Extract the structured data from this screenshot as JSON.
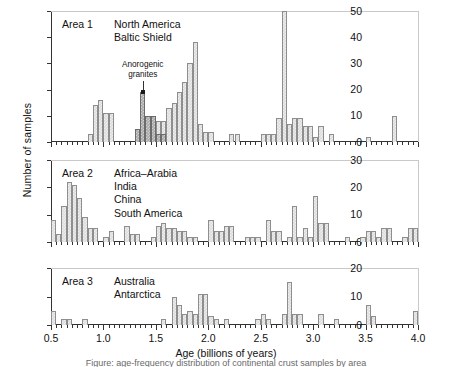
{
  "figure": {
    "xlabel": "Age (billions of years)",
    "ylabel": "Number of samples",
    "caption": "Figure: age-frequency distribution of continental crust samples by area"
  },
  "annotation": {
    "line1": "Anorogenic",
    "line2": "granites"
  },
  "panels": [
    {
      "area": "Area 1",
      "regions": [
        "North America",
        "Baltic Shield"
      ],
      "yticks": [
        0,
        10,
        20,
        30,
        40,
        50
      ],
      "ymax": 50
    },
    {
      "area": "Area 2",
      "regions": [
        "Africa–Arabia",
        "India",
        "China",
        "South America"
      ],
      "yticks": [
        0,
        10,
        20,
        30
      ],
      "ymax": 30
    },
    {
      "area": "Area 3",
      "regions": [
        "Australia",
        "Antarctica"
      ],
      "yticks": [
        0,
        10,
        20
      ],
      "ymax": 20
    }
  ],
  "xticks_major": [
    "0.5",
    "1.0",
    "1.5",
    "2.0",
    "2.5",
    "3.0",
    "3.5",
    "4.0"
  ],
  "chart_data": {
    "type": "bar",
    "xlabel": "Age (billions of years)",
    "ylabel": "Number of samples",
    "xlim": [
      0.5,
      4.0
    ],
    "bin_width": 0.05,
    "grid": false,
    "legend": null,
    "panels": [
      {
        "name": "Area 1",
        "regions": [
          "North America",
          "Baltic Shield"
        ],
        "ylim": [
          0,
          50
        ],
        "yticks": [
          0,
          10,
          20,
          30,
          40,
          50
        ],
        "series": [
          {
            "name": "samples",
            "fill": "light",
            "bins": [
              {
                "x": 0.85,
                "v": 3
              },
              {
                "x": 0.9,
                "v": 14
              },
              {
                "x": 0.95,
                "v": 16
              },
              {
                "x": 1.0,
                "v": 11
              },
              {
                "x": 1.05,
                "v": 11
              },
              {
                "x": 1.5,
                "v": 8
              },
              {
                "x": 1.55,
                "v": 8
              },
              {
                "x": 1.6,
                "v": 13
              },
              {
                "x": 1.65,
                "v": 15
              },
              {
                "x": 1.7,
                "v": 19
              },
              {
                "x": 1.75,
                "v": 23
              },
              {
                "x": 1.8,
                "v": 30
              },
              {
                "x": 1.85,
                "v": 38
              },
              {
                "x": 1.9,
                "v": 7
              },
              {
                "x": 1.95,
                "v": 4
              },
              {
                "x": 2.0,
                "v": 4
              },
              {
                "x": 2.2,
                "v": 3
              },
              {
                "x": 2.25,
                "v": 3
              },
              {
                "x": 2.5,
                "v": 3
              },
              {
                "x": 2.55,
                "v": 3
              },
              {
                "x": 2.6,
                "v": 3
              },
              {
                "x": 2.65,
                "v": 9
              },
              {
                "x": 2.7,
                "v": 50
              },
              {
                "x": 2.75,
                "v": 7
              },
              {
                "x": 2.8,
                "v": 9
              },
              {
                "x": 2.85,
                "v": 9
              },
              {
                "x": 2.9,
                "v": 6
              },
              {
                "x": 2.95,
                "v": 6
              },
              {
                "x": 3.0,
                "v": 2
              },
              {
                "x": 3.05,
                "v": 6
              },
              {
                "x": 3.15,
                "v": 3
              },
              {
                "x": 3.5,
                "v": 2
              },
              {
                "x": 3.75,
                "v": 10
              }
            ]
          },
          {
            "name": "anorogenic granites",
            "fill": "dark",
            "bins": [
              {
                "x": 1.3,
                "v": 5
              },
              {
                "x": 1.35,
                "v": 19
              },
              {
                "x": 1.4,
                "v": 10
              },
              {
                "x": 1.45,
                "v": 10
              },
              {
                "x": 1.5,
                "v": 3
              },
              {
                "x": 1.55,
                "v": 3
              }
            ]
          }
        ]
      },
      {
        "name": "Area 2",
        "regions": [
          "Africa–Arabia",
          "India",
          "China",
          "South America"
        ],
        "ylim": [
          0,
          30
        ],
        "yticks": [
          0,
          10,
          20,
          30
        ],
        "series": [
          {
            "name": "samples",
            "fill": "light",
            "bins": [
              {
                "x": 0.5,
                "v": 8
              },
              {
                "x": 0.55,
                "v": 3
              },
              {
                "x": 0.6,
                "v": 13
              },
              {
                "x": 0.65,
                "v": 22
              },
              {
                "x": 0.7,
                "v": 21
              },
              {
                "x": 0.75,
                "v": 16
              },
              {
                "x": 0.8,
                "v": 9
              },
              {
                "x": 0.85,
                "v": 5
              },
              {
                "x": 0.9,
                "v": 5
              },
              {
                "x": 1.0,
                "v": 2
              },
              {
                "x": 1.05,
                "v": 4
              },
              {
                "x": 1.2,
                "v": 6
              },
              {
                "x": 1.25,
                "v": 3
              },
              {
                "x": 1.3,
                "v": 3
              },
              {
                "x": 1.45,
                "v": 2
              },
              {
                "x": 1.5,
                "v": 6
              },
              {
                "x": 1.55,
                "v": 7
              },
              {
                "x": 1.6,
                "v": 5
              },
              {
                "x": 1.65,
                "v": 5
              },
              {
                "x": 1.7,
                "v": 4
              },
              {
                "x": 1.75,
                "v": 4
              },
              {
                "x": 1.8,
                "v": 2
              },
              {
                "x": 1.85,
                "v": 2
              },
              {
                "x": 2.0,
                "v": 8
              },
              {
                "x": 2.05,
                "v": 4
              },
              {
                "x": 2.1,
                "v": 4
              },
              {
                "x": 2.15,
                "v": 6
              },
              {
                "x": 2.2,
                "v": 6
              },
              {
                "x": 2.35,
                "v": 2
              },
              {
                "x": 2.4,
                "v": 2
              },
              {
                "x": 2.45,
                "v": 2
              },
              {
                "x": 2.55,
                "v": 8
              },
              {
                "x": 2.6,
                "v": 4
              },
              {
                "x": 2.65,
                "v": 4
              },
              {
                "x": 2.75,
                "v": 2
              },
              {
                "x": 2.8,
                "v": 13
              },
              {
                "x": 2.85,
                "v": 2
              },
              {
                "x": 2.9,
                "v": 5
              },
              {
                "x": 2.95,
                "v": 2
              },
              {
                "x": 3.0,
                "v": 17
              },
              {
                "x": 3.05,
                "v": 7
              },
              {
                "x": 3.1,
                "v": 7
              },
              {
                "x": 3.3,
                "v": 2
              },
              {
                "x": 3.45,
                "v": 2
              },
              {
                "x": 3.5,
                "v": 4
              },
              {
                "x": 3.55,
                "v": 4
              },
              {
                "x": 3.6,
                "v": 2
              },
              {
                "x": 3.65,
                "v": 5
              },
              {
                "x": 3.7,
                "v": 5
              },
              {
                "x": 3.85,
                "v": 2
              },
              {
                "x": 3.9,
                "v": 5
              },
              {
                "x": 3.95,
                "v": 5
              }
            ]
          }
        ]
      },
      {
        "name": "Area 3",
        "regions": [
          "Australia",
          "Antarctica"
        ],
        "ylim": [
          0,
          20
        ],
        "yticks": [
          0,
          10,
          20
        ],
        "series": [
          {
            "name": "samples",
            "fill": "light",
            "bins": [
              {
                "x": 0.5,
                "v": 5
              },
              {
                "x": 0.6,
                "v": 2
              },
              {
                "x": 0.65,
                "v": 2
              },
              {
                "x": 0.8,
                "v": 2
              },
              {
                "x": 1.55,
                "v": 2
              },
              {
                "x": 1.65,
                "v": 10
              },
              {
                "x": 1.7,
                "v": 7
              },
              {
                "x": 1.75,
                "v": 4
              },
              {
                "x": 1.8,
                "v": 5
              },
              {
                "x": 1.85,
                "v": 4
              },
              {
                "x": 1.9,
                "v": 11
              },
              {
                "x": 1.95,
                "v": 11
              },
              {
                "x": 2.0,
                "v": 3
              },
              {
                "x": 2.05,
                "v": 2
              },
              {
                "x": 2.15,
                "v": 2
              },
              {
                "x": 2.45,
                "v": 2
              },
              {
                "x": 2.5,
                "v": 4
              },
              {
                "x": 2.55,
                "v": 2
              },
              {
                "x": 2.7,
                "v": 4
              },
              {
                "x": 2.75,
                "v": 15
              },
              {
                "x": 2.8,
                "v": 4
              },
              {
                "x": 2.85,
                "v": 4
              },
              {
                "x": 3.05,
                "v": 4
              },
              {
                "x": 3.2,
                "v": 2
              },
              {
                "x": 3.5,
                "v": 7
              },
              {
                "x": 3.55,
                "v": 3
              },
              {
                "x": 3.95,
                "v": 5
              }
            ]
          }
        ]
      }
    ]
  }
}
